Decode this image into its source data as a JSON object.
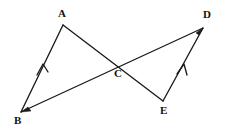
{
  "figure": {
    "width": 225,
    "height": 130,
    "background_color": "#ffffff",
    "stroke_color": "#1a1a1a",
    "label_color": "#111111"
  },
  "points": {
    "A": {
      "label": "A",
      "x": 63,
      "y": 25,
      "label_x": 58,
      "label_y": 8
    },
    "B": {
      "label": "B",
      "x": 21,
      "y": 112,
      "label_x": 14,
      "label_y": 115
    },
    "C": {
      "label": "C",
      "x": 118,
      "y": 64,
      "label_x": 114,
      "label_y": 68
    },
    "D": {
      "label": "D",
      "x": 203,
      "y": 28,
      "label_x": 203,
      "label_y": 9
    },
    "E": {
      "label": "E",
      "x": 163,
      "y": 101,
      "label_x": 160,
      "label_y": 105
    }
  },
  "segments": [
    {
      "name": "segment-BA",
      "from": "B",
      "to": "A",
      "d": "M 21 112 L 63 25"
    },
    {
      "name": "segment-AE",
      "from": "A",
      "to": "E",
      "d": "M 63 25 L 163 101"
    },
    {
      "name": "segment-BD",
      "from": "B",
      "to": "D",
      "d": "M 21 112 L 203 28"
    },
    {
      "name": "segment-ED",
      "from": "E",
      "to": "D",
      "d": "M 163 101 L 203 28"
    }
  ],
  "markers": [
    {
      "name": "parallel-mark-ba",
      "on": "segment-BA",
      "kind": "single-chevron",
      "d": "M 37 75 L 43 64 L 48 72"
    },
    {
      "name": "parallel-mark-ed",
      "on": "segment-ED",
      "kind": "single-chevron",
      "d": "M 177 74 L 184 64 L 187 75"
    }
  ],
  "arrowheads": [
    {
      "name": "arrowhead-at-d",
      "at": "D",
      "d": "M 203 28 L 196 33 L 199 35 Z"
    },
    {
      "name": "arrowhead-at-b",
      "at": "B",
      "d": "M 21 112 L 28 107 L 31 111 Z"
    }
  ],
  "caption": ""
}
